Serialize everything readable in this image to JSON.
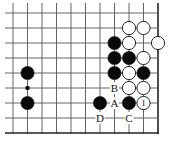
{
  "diagram": {
    "type": "go-board-fragment",
    "grid": {
      "columns": 11,
      "rows": 9,
      "origin_x": 13,
      "origin_y": 13,
      "spacing_x": 14.5,
      "spacing_y": 15,
      "right_edge": true,
      "bottom_edge": true,
      "line_color": "#555555",
      "edge_color": "#222222"
    },
    "star_points": [
      {
        "col": 1,
        "row": 5
      }
    ],
    "stones": [
      {
        "color": "white",
        "col": 8,
        "row": 1
      },
      {
        "color": "white",
        "col": 9,
        "row": 1
      },
      {
        "color": "black",
        "col": 7,
        "row": 2
      },
      {
        "color": "white",
        "col": 8,
        "row": 2
      },
      {
        "color": "white",
        "col": 10,
        "row": 2
      },
      {
        "color": "black",
        "col": 7,
        "row": 3
      },
      {
        "color": "black",
        "col": 8,
        "row": 3
      },
      {
        "color": "white",
        "col": 9,
        "row": 3
      },
      {
        "color": "black",
        "col": 7,
        "row": 4
      },
      {
        "color": "white",
        "col": 8,
        "row": 4
      },
      {
        "color": "black",
        "col": 9,
        "row": 4
      },
      {
        "color": "white",
        "col": 8,
        "row": 5
      },
      {
        "color": "white",
        "col": 9,
        "row": 5
      },
      {
        "color": "black",
        "col": 6,
        "row": 6
      },
      {
        "color": "black",
        "col": 8,
        "row": 6
      },
      {
        "color": "white",
        "col": 9,
        "row": 6,
        "number": "1"
      },
      {
        "color": "black",
        "col": 1,
        "row": 4
      },
      {
        "color": "black",
        "col": 1,
        "row": 6
      }
    ],
    "labels": [
      {
        "text": "B",
        "col": 7,
        "row": 5
      },
      {
        "text": "A",
        "col": 7,
        "row": 6
      },
      {
        "text": "D",
        "col": 6,
        "row": 7
      },
      {
        "text": "C",
        "col": 8,
        "row": 7
      }
    ],
    "colors": {
      "black_stone": "#0a0a0a",
      "white_stone": "#ffffff",
      "stone_outline": "#111111",
      "background": "#ffffff"
    }
  }
}
